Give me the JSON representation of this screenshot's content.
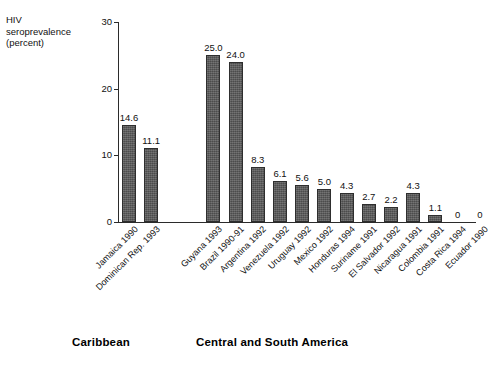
{
  "chart_data": {
    "type": "bar",
    "title": "",
    "subtitle": "",
    "xlabel": "",
    "ylabel": "HIV\nseroprevalence\n(percent)",
    "ylim": [
      0,
      30
    ],
    "yticks": [
      "0",
      "10",
      "20",
      "30"
    ],
    "grid": false,
    "legend": "none",
    "categories": [
      "Jamaica 1990",
      "Dominican Rep. 1993",
      "Guyana 1993",
      "Brazil 1990-91",
      "Argentina 1992",
      "Venezuela 1992",
      "Uruguay 1992",
      "Mexico 1992",
      "Honduras 1994",
      "Suriname 1991",
      "El Salvador 1992",
      "Nicaragua 1991",
      "Colombia 1991",
      "Costa Rica 1994",
      "Ecuador 1990"
    ],
    "values": [
      14.6,
      11.1,
      25.0,
      24.0,
      8.3,
      6.1,
      5.6,
      5.0,
      4.3,
      2.7,
      2.2,
      4.3,
      1.1,
      0,
      0
    ],
    "value_labels": [
      "14.6",
      "11.1",
      "25.0",
      "24.0",
      "8.3",
      "6.1",
      "5.6",
      "5.0",
      "4.3",
      "2.7",
      "2.2",
      "4.3",
      "1.1",
      "0",
      "0"
    ],
    "bar_color": "#585858",
    "bar_edge_color": "#2e2e2e",
    "axis_color": "#2b2b2b",
    "groups": [
      {
        "label": "Caribbean",
        "start_index": 0,
        "end_index": 1
      },
      {
        "label": "Central and South America",
        "start_index": 2,
        "end_index": 14
      }
    ]
  },
  "axis": {
    "y_label_text": "HIV\nseroprevalence\n(percent)",
    "ticks": [
      {
        "label": "30",
        "value": 30
      },
      {
        "label": "20",
        "value": 20
      },
      {
        "label": "10",
        "value": 10
      },
      {
        "label": "0",
        "value": 0
      }
    ]
  },
  "groups": {
    "caribbean": "Caribbean",
    "central_south_america": "Central and South America"
  }
}
